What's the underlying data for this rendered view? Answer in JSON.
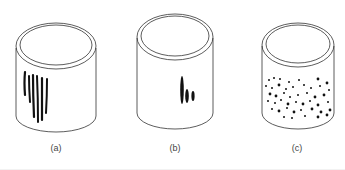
{
  "figure": {
    "panels": [
      {
        "id": "a",
        "label": "(a)",
        "marking": "long-vertical-streaks",
        "streak_count": 6
      },
      {
        "id": "b",
        "label": "(b)",
        "marking": "short-streak-cluster",
        "streak_count": 3
      },
      {
        "id": "c",
        "label": "(c)",
        "marking": "scattered-dots"
      }
    ]
  }
}
